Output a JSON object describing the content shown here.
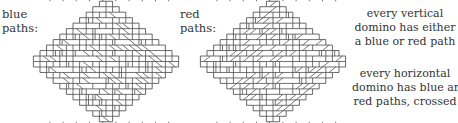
{
  "figure": {
    "left_panel": {
      "label_lines": [
        "blue",
        "paths:"
      ],
      "diamond": {
        "order": 11,
        "cell": 6.6,
        "center_x": 106,
        "center_y": 61.5,
        "seed": 7
      }
    },
    "right_panel": {
      "label_lines": [
        "red",
        "paths:"
      ],
      "diamond": {
        "order": 11,
        "cell": 6.6,
        "center_x": 273,
        "center_y": 61.5,
        "seed": 13
      }
    },
    "captions": {
      "vertical": [
        "every vertical",
        "domino has either",
        "a blue or red path"
      ],
      "horizontal": [
        "every horizontal",
        "domino has blue and",
        "red paths, crossed"
      ]
    },
    "colors": {
      "ink": "#444444",
      "text": "#333333",
      "background": "#ffffff"
    }
  }
}
